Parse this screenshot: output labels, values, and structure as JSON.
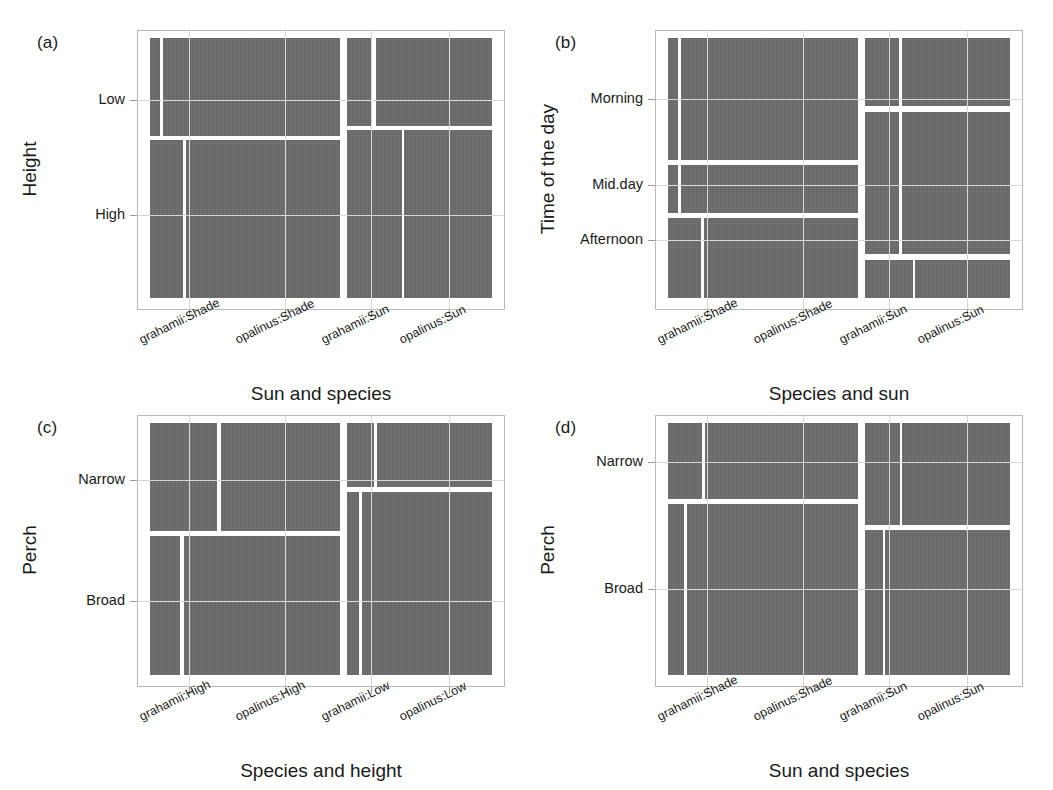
{
  "figure": {
    "width": 1053,
    "height": 790,
    "tile_color": "#6b6b6b",
    "frame_color": "#b9b9b9",
    "gap_color": "#ffffff"
  },
  "chart_data": {
    "type": "mosaic",
    "title": "",
    "panels": [
      {
        "tag": "(a)",
        "xlabel": "Sun and species",
        "ylabel": "Height",
        "xticks": [
          "grahamii:Shade",
          "opalinus:Shade",
          "grahamii:Sun",
          "opalinus:Sun"
        ],
        "yticks": [
          "Low",
          "High"
        ],
        "xtick_pos": [
          0.115,
          0.395,
          0.645,
          0.875
        ],
        "ytick_pos": [
          0.24,
          0.68
        ],
        "groups": [
          {
            "name": "Shade",
            "x": 0.0,
            "w": 0.555,
            "rows": [
              {
                "label": "Low",
                "y": 0.0,
                "h": 0.375,
                "cells": [
                  {
                    "label": "grahamii:Shade",
                    "x": 0.0,
                    "w": 0.055
                  },
                  {
                    "label": "opalinus:Shade",
                    "x": 0.068,
                    "w": 0.932
                  }
                ]
              },
              {
                "label": "High",
                "y": 0.392,
                "h": 0.608,
                "cells": [
                  {
                    "label": "grahamii:Shade",
                    "x": 0.0,
                    "w": 0.175
                  },
                  {
                    "label": "opalinus:Shade",
                    "x": 0.188,
                    "w": 0.812
                  }
                ]
              }
            ]
          },
          {
            "name": "Sun",
            "x": 0.575,
            "w": 0.425,
            "rows": [
              {
                "label": "Low",
                "y": 0.0,
                "h": 0.337,
                "cells": [
                  {
                    "label": "grahamii:Sun",
                    "x": 0.0,
                    "w": 0.175
                  },
                  {
                    "label": "opalinus:Sun",
                    "x": 0.2,
                    "w": 0.8
                  }
                ]
              },
              {
                "label": "High",
                "y": 0.354,
                "h": 0.646,
                "cells": [
                  {
                    "label": "grahamii:Sun",
                    "x": 0.0,
                    "w": 0.378
                  },
                  {
                    "label": "opalinus:Sun",
                    "x": 0.396,
                    "w": 0.604
                  }
                ]
              }
            ]
          }
        ]
      },
      {
        "tag": "(b)",
        "xlabel": "Species and sun",
        "ylabel": "Time of the day",
        "xticks": [
          "grahamii:Shade",
          "opalinus:Shade",
          "grahamii:Sun",
          "opalinus:Sun"
        ],
        "yticks": [
          "Morning",
          "Mid.day",
          "Afternoon"
        ],
        "xtick_pos": [
          0.115,
          0.395,
          0.645,
          0.875
        ],
        "ytick_pos": [
          0.235,
          0.565,
          0.775
        ],
        "groups": [
          {
            "name": "Shade",
            "x": 0.0,
            "w": 0.555,
            "rows": [
              {
                "label": "Morning",
                "y": 0.0,
                "h": 0.47,
                "cells": [
                  {
                    "label": "grahamii:Shade",
                    "x": 0.0,
                    "w": 0.055
                  },
                  {
                    "label": "opalinus:Shade",
                    "x": 0.068,
                    "w": 0.932
                  }
                ]
              },
              {
                "label": "Mid.day",
                "y": 0.489,
                "h": 0.183,
                "cells": [
                  {
                    "label": "grahamii:Shade",
                    "x": 0.0,
                    "w": 0.055
                  },
                  {
                    "label": "opalinus:Shade",
                    "x": 0.068,
                    "w": 0.932
                  }
                ]
              },
              {
                "label": "Afternoon",
                "y": 0.692,
                "h": 0.308,
                "cells": [
                  {
                    "label": "grahamii:Shade",
                    "x": 0.0,
                    "w": 0.175
                  },
                  {
                    "label": "opalinus:Shade",
                    "x": 0.191,
                    "w": 0.809
                  }
                ]
              }
            ]
          },
          {
            "name": "Sun",
            "x": 0.575,
            "w": 0.425,
            "rows": [
              {
                "label": "Morning",
                "y": 0.0,
                "h": 0.263,
                "cells": [
                  {
                    "label": "grahamii:Sun",
                    "x": 0.0,
                    "w": 0.237
                  },
                  {
                    "label": "opalinus:Sun",
                    "x": 0.256,
                    "w": 0.744
                  }
                ]
              },
              {
                "label": "Mid.day",
                "y": 0.283,
                "h": 0.549,
                "cells": [
                  {
                    "label": "grahamii:Sun",
                    "x": 0.0,
                    "w": 0.237
                  },
                  {
                    "label": "opalinus:Sun",
                    "x": 0.256,
                    "w": 0.744
                  }
                ]
              },
              {
                "label": "Afternoon",
                "y": 0.852,
                "h": 0.148,
                "cells": [
                  {
                    "label": "grahamii:Sun",
                    "x": 0.0,
                    "w": 0.33
                  },
                  {
                    "label": "opalinus:Sun",
                    "x": 0.348,
                    "w": 0.652
                  }
                ]
              }
            ]
          }
        ]
      },
      {
        "tag": "(c)",
        "xlabel": "Species and height",
        "ylabel": "Perch",
        "xticks": [
          "grahamii:High",
          "opalinus:High",
          "grahamii:Low",
          "opalinus:Low"
        ],
        "yticks": [
          "Narrow",
          "Broad"
        ],
        "xtick_pos": [
          0.115,
          0.395,
          0.645,
          0.875
        ],
        "ytick_pos": [
          0.225,
          0.705
        ],
        "groups": [
          {
            "name": "High",
            "x": 0.0,
            "w": 0.555,
            "rows": [
              {
                "label": "Narrow",
                "y": 0.0,
                "h": 0.43,
                "cells": [
                  {
                    "label": "grahamii:High",
                    "x": 0.0,
                    "w": 0.355
                  },
                  {
                    "label": "opalinus:High",
                    "x": 0.372,
                    "w": 0.628
                  }
                ]
              },
              {
                "label": "Broad",
                "y": 0.449,
                "h": 0.551,
                "cells": [
                  {
                    "label": "grahamii:High",
                    "x": 0.0,
                    "w": 0.16
                  },
                  {
                    "label": "opalinus:High",
                    "x": 0.177,
                    "w": 0.823
                  }
                ]
              }
            ]
          },
          {
            "name": "Low",
            "x": 0.575,
            "w": 0.425,
            "rows": [
              {
                "label": "Narrow",
                "y": 0.0,
                "h": 0.255,
                "cells": [
                  {
                    "label": "grahamii:Low",
                    "x": 0.0,
                    "w": 0.19
                  },
                  {
                    "label": "opalinus:Low",
                    "x": 0.21,
                    "w": 0.79
                  }
                ]
              },
              {
                "label": "Broad",
                "y": 0.275,
                "h": 0.725,
                "cells": [
                  {
                    "label": "grahamii:Low",
                    "x": 0.0,
                    "w": 0.085
                  },
                  {
                    "label": "opalinus:Low",
                    "x": 0.103,
                    "w": 0.897
                  }
                ]
              }
            ]
          }
        ]
      },
      {
        "tag": "(d)",
        "xlabel": "Sun and species",
        "ylabel": "Perch",
        "xticks": [
          "grahamii:Shade",
          "opalinus:Shade",
          "grahamii:Sun",
          "opalinus:Sun"
        ],
        "yticks": [
          "Narrow",
          "Broad"
        ],
        "xtick_pos": [
          0.115,
          0.395,
          0.645,
          0.875
        ],
        "ytick_pos": [
          0.155,
          0.66
        ],
        "groups": [
          {
            "name": "Shade",
            "x": 0.0,
            "w": 0.555,
            "rows": [
              {
                "label": "Narrow",
                "y": 0.0,
                "h": 0.3,
                "cells": [
                  {
                    "label": "grahamii:Shade",
                    "x": 0.0,
                    "w": 0.178
                  },
                  {
                    "label": "opalinus:Shade",
                    "x": 0.196,
                    "w": 0.804
                  }
                ]
              },
              {
                "label": "Broad",
                "y": 0.32,
                "h": 0.68,
                "cells": [
                  {
                    "label": "grahamii:Shade",
                    "x": 0.0,
                    "w": 0.082
                  },
                  {
                    "label": "opalinus:Shade",
                    "x": 0.1,
                    "w": 0.9
                  }
                ]
              }
            ]
          },
          {
            "name": "Sun",
            "x": 0.575,
            "w": 0.425,
            "rows": [
              {
                "label": "Narrow",
                "y": 0.0,
                "h": 0.405,
                "cells": [
                  {
                    "label": "grahamii:Sun",
                    "x": 0.0,
                    "w": 0.24
                  },
                  {
                    "label": "opalinus:Sun",
                    "x": 0.258,
                    "w": 0.742
                  }
                ]
              },
              {
                "label": "Broad",
                "y": 0.425,
                "h": 0.575,
                "cells": [
                  {
                    "label": "grahamii:Sun",
                    "x": 0.0,
                    "w": 0.125
                  },
                  {
                    "label": "opalinus:Sun",
                    "x": 0.143,
                    "w": 0.857
                  }
                ]
              }
            ]
          }
        ]
      }
    ]
  }
}
